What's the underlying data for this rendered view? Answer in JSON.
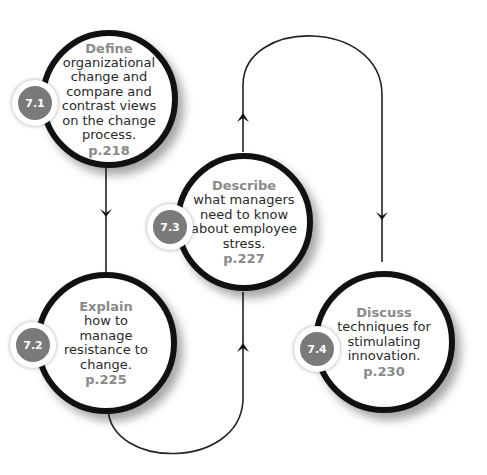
{
  "diagram": {
    "type": "learning-objectives-flow",
    "nodes": [
      {
        "id": "7.1",
        "badge": "7.1",
        "verb": "Define",
        "description": "organizational change and compare and contrast views on the change process.",
        "page": "p.218"
      },
      {
        "id": "7.2",
        "badge": "7.2",
        "verb": "Explain",
        "description": "how to manage resistance to change.",
        "page": "p.225"
      },
      {
        "id": "7.3",
        "badge": "7.3",
        "verb": "Describe",
        "description": "what managers need to know about employee stress.",
        "page": "p.227"
      },
      {
        "id": "7.4",
        "badge": "7.4",
        "verb": "Discuss",
        "description": "techniques for stimulating innovation.",
        "page": "p.230"
      }
    ],
    "edges": [
      {
        "from": "7.1",
        "to": "7.2",
        "direction": "down"
      },
      {
        "from": "7.2",
        "to": "7.3",
        "direction": "up",
        "route": "curve-below"
      },
      {
        "from": "7.3",
        "to": "7.4",
        "direction": "down",
        "route": "arch-above"
      }
    ],
    "colors": {
      "ring": "#111111",
      "badge": "#7a7a7a",
      "verb": "#8a8a8a",
      "text": "#2a2a2a",
      "line": "#222222"
    }
  }
}
